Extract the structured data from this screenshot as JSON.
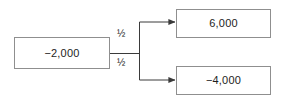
{
  "diagram": {
    "type": "decision-tree",
    "title": "",
    "root": {
      "value": "−2,000"
    },
    "branches": [
      {
        "probability": "½",
        "outcome": "6,000",
        "position": "upper"
      },
      {
        "probability": "½",
        "outcome": "−4,000",
        "position": "lower"
      }
    ],
    "colors": {
      "box_border": "#8f8f8f",
      "edge_line": "#3a3a3a",
      "text": "#1d1d1d",
      "background": "#ffffff"
    }
  }
}
